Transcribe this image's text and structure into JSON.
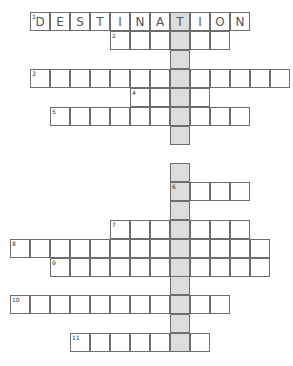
{
  "puzzle": {
    "type": "crossword",
    "highlight_color": "#dcdcdc",
    "border_color": "#6e6e6e",
    "highlight_column_x": 170,
    "cell_w": 20,
    "cell_h": 19,
    "rows": [
      {
        "number": "1",
        "y": 12,
        "x": 30,
        "length": 11,
        "letters": [
          "D",
          "E",
          "S",
          "T",
          "I",
          "N",
          "A",
          "T",
          "I",
          "O",
          "N"
        ]
      },
      {
        "number": "2",
        "y": 31,
        "x": 110,
        "length": 6,
        "letters": []
      },
      {
        "number": "",
        "y": 50,
        "x": 170,
        "length": 1,
        "letters": []
      },
      {
        "number": "3",
        "y": 69,
        "x": 30,
        "length": 13,
        "letters": []
      },
      {
        "number": "4",
        "y": 88,
        "x": 130,
        "length": 4,
        "letters": []
      },
      {
        "number": "5",
        "y": 107,
        "x": 50,
        "length": 10,
        "letters": []
      },
      {
        "number": "",
        "y": 126,
        "x": 170,
        "length": 1,
        "letters": []
      },
      {
        "number": "",
        "y": 163,
        "x": 170,
        "length": 1,
        "letters": []
      },
      {
        "number": "6",
        "y": 182,
        "x": 170,
        "length": 4,
        "letters": []
      },
      {
        "number": "",
        "y": 201,
        "x": 170,
        "length": 1,
        "letters": []
      },
      {
        "number": "7",
        "y": 220,
        "x": 110,
        "length": 7,
        "letters": []
      },
      {
        "number": "8",
        "y": 239,
        "x": 10,
        "length": 13,
        "letters": []
      },
      {
        "number": "9",
        "y": 258,
        "x": 50,
        "length": 11,
        "letters": []
      },
      {
        "number": "",
        "y": 276,
        "x": 170,
        "length": 1,
        "letters": []
      },
      {
        "number": "10",
        "y": 295,
        "x": 10,
        "length": 11,
        "letters": []
      },
      {
        "number": "",
        "y": 314,
        "x": 170,
        "length": 1,
        "letters": []
      },
      {
        "number": "11",
        "y": 333,
        "x": 70,
        "length": 7,
        "letters": []
      }
    ]
  }
}
